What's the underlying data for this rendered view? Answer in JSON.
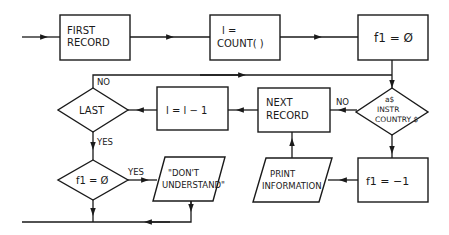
{
  "flowchart": {
    "nodes": {
      "first_record": {
        "type": "process",
        "lines": [
          "FIRST",
          "RECORD"
        ]
      },
      "count": {
        "type": "process",
        "lines": [
          "l  =",
          "COUNT( )"
        ]
      },
      "f1_zero_init": {
        "type": "process",
        "lines": [
          "f1 = Ø"
        ]
      },
      "instr_decision": {
        "type": "decision",
        "lines": [
          "a$",
          "INSTR",
          "COUNTRY $"
        ]
      },
      "next_record": {
        "type": "process",
        "lines": [
          "NEXT",
          "RECORD"
        ]
      },
      "decrement": {
        "type": "process",
        "lines": [
          "l  = l  − 1"
        ]
      },
      "last_decision": {
        "type": "decision",
        "lines": [
          "LAST"
        ]
      },
      "f1_zero_decision": {
        "type": "decision",
        "lines": [
          "f1 = Ø"
        ]
      },
      "dont_understand": {
        "type": "io",
        "lines": [
          "\"DON'T",
          "UNDERSTAND\""
        ]
      },
      "f1_minus_one": {
        "type": "process",
        "lines": [
          "f1 = −1"
        ]
      },
      "print_information": {
        "type": "io",
        "lines": [
          "PRINT",
          "INFORMATION"
        ]
      }
    },
    "edge_labels": {
      "instr_no": "NO",
      "last_no": "NO",
      "last_yes": "YES",
      "f1_zero_yes": "YES"
    },
    "colors": {
      "stroke": "#1a1a1a",
      "background": "#ffffff"
    }
  }
}
